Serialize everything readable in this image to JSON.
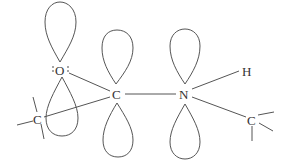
{
  "diagram": {
    "title": "",
    "atoms": {
      "oxygen": {
        "label": "O",
        "lone_pair_dots": true
      },
      "carbonyl_carbon": {
        "label": "C"
      },
      "nitrogen": {
        "label": "N"
      },
      "hydrogen": {
        "label": "H"
      },
      "left_carbon": {
        "label": "C"
      },
      "right_carbon": {
        "label": "C"
      }
    },
    "colors": {
      "line": "#555555",
      "text": "#333333",
      "background": "#ffffff"
    }
  }
}
